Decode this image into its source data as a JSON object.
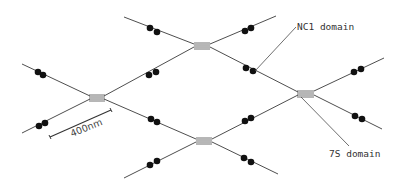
{
  "figure": {
    "type": "schematic diagram of collagen IV network",
    "background_color": "#ffffff",
    "line_color": "#3a3a3a",
    "dot_color": "#111111"
  },
  "labels": {
    "nc1": "NC1 domain",
    "s7": "7S domain"
  },
  "scale_bar": {
    "label": "400nm"
  },
  "junctions": [
    {
      "id": "left",
      "x": 97,
      "y": 97
    },
    {
      "id": "top",
      "x": 202,
      "y": 45
    },
    {
      "id": "right",
      "x": 306,
      "y": 93
    },
    {
      "id": "bottom",
      "x": 204,
      "y": 140
    }
  ]
}
